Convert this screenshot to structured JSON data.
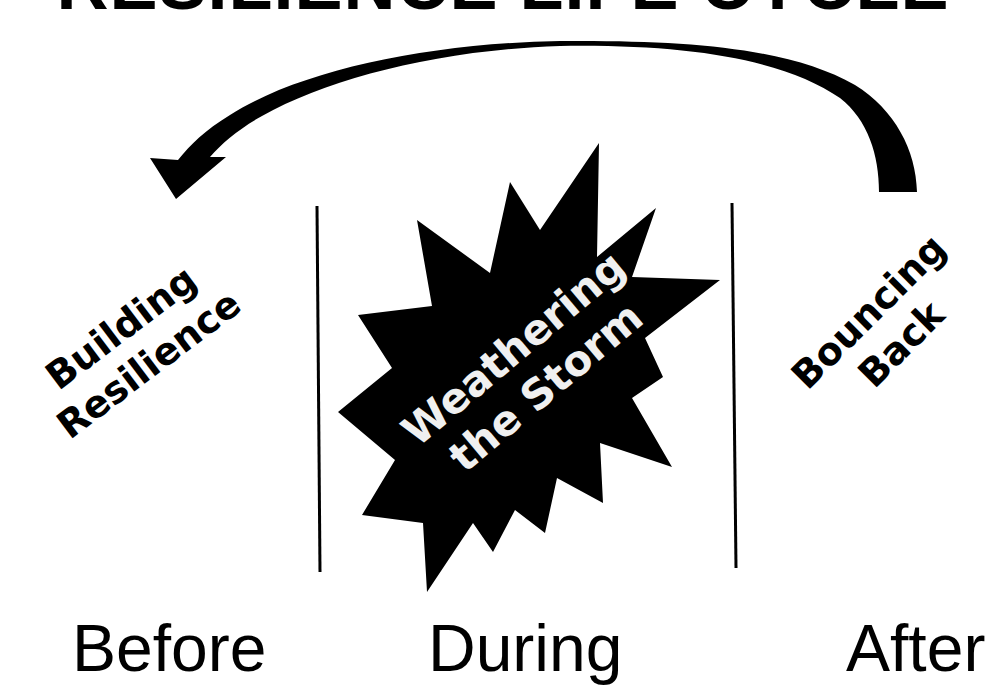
{
  "title": "RESILIENCE LIFE CYCLE",
  "stages": {
    "before": {
      "caption": "Before",
      "label_line1": "Building",
      "label_line2": "Resilience"
    },
    "during": {
      "caption": "During",
      "label_line1": "Weathering",
      "label_line2": "the Storm"
    },
    "after": {
      "caption": "After",
      "label_line1": "Bouncing",
      "label_line2": "Back"
    }
  },
  "cycle_arrow": {
    "from": "After",
    "to": "Before",
    "icon": "curved-arrow-icon"
  },
  "colors": {
    "ink": "#000000",
    "background": "#ffffff",
    "starburst_text": "#f0f0f0"
  }
}
